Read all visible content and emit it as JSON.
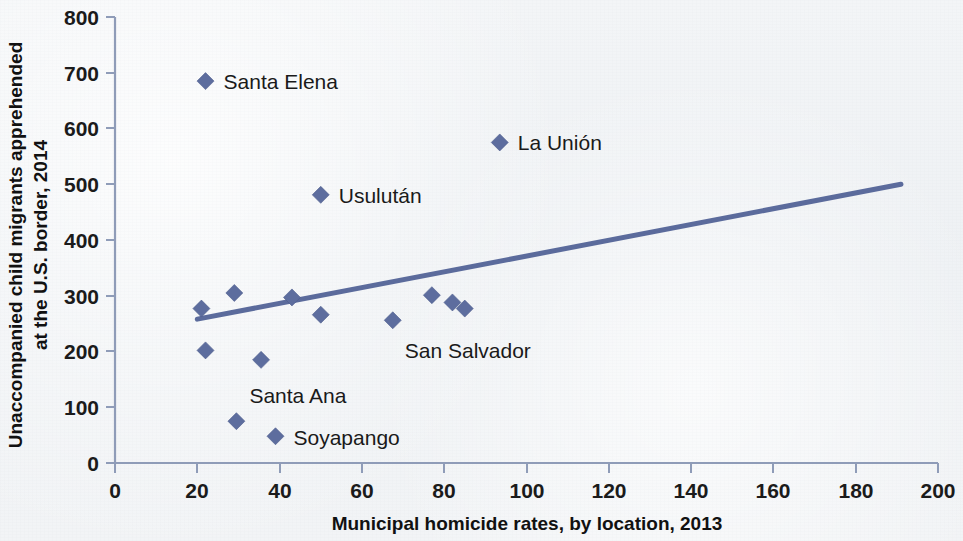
{
  "chart_data": {
    "type": "scatter",
    "title": "",
    "xlabel": "Municipal homicide rates, by location, 2013",
    "ylabel": "Unaccompanied child migrants apprehended at the U.S. border, 2014",
    "ylabel_line1": "Unaccompanied child migrants apprehended",
    "ylabel_line2": "at the U.S. border, 2014",
    "xlim": [
      0,
      200
    ],
    "ylim": [
      0,
      800
    ],
    "xticks": [
      0,
      20,
      40,
      60,
      80,
      100,
      120,
      140,
      160,
      180,
      200
    ],
    "yticks": [
      0,
      100,
      200,
      300,
      400,
      500,
      600,
      700,
      800
    ],
    "xtick_labels": [
      "0",
      "20",
      "40",
      "60",
      "80",
      "100",
      "120",
      "140",
      "160",
      "180",
      "200"
    ],
    "ytick_labels": [
      "0",
      "100",
      "200",
      "300",
      "400",
      "500",
      "600",
      "700",
      "800"
    ],
    "grid": false,
    "legend": "none",
    "marker_shape": "diamond",
    "marker_color": "#5d6d9e",
    "trendline_color": "#5b6b9c",
    "axis_color": "#8f9cb8",
    "background_color": "#f1f3f5",
    "points": [
      {
        "label": "Santa Elena",
        "x": 22,
        "y": 685,
        "label_pos": "right"
      },
      {
        "label": "La Unión",
        "x": 93.5,
        "y": 575,
        "label_pos": "right"
      },
      {
        "label": "Usulután",
        "x": 50,
        "y": 481,
        "label_pos": "right"
      },
      {
        "label": "",
        "x": 21,
        "y": 277,
        "label_pos": "none"
      },
      {
        "label": "",
        "x": 29,
        "y": 305,
        "label_pos": "none"
      },
      {
        "label": "",
        "x": 43,
        "y": 297,
        "label_pos": "none"
      },
      {
        "label": "",
        "x": 50,
        "y": 266,
        "label_pos": "none"
      },
      {
        "label": "",
        "x": 67.5,
        "y": 256,
        "label_pos": "none"
      },
      {
        "label": "",
        "x": 77,
        "y": 301,
        "label_pos": "none"
      },
      {
        "label": "",
        "x": 82,
        "y": 288,
        "label_pos": "none"
      },
      {
        "label": "",
        "x": 85,
        "y": 277,
        "label_pos": "none"
      },
      {
        "label": "",
        "x": 22,
        "y": 202,
        "label_pos": "none"
      },
      {
        "label": "",
        "x": 35.5,
        "y": 185,
        "label_pos": "none"
      },
      {
        "label": "Santa Ana",
        "x": 29.5,
        "y": 75,
        "label_pos": "above-right"
      },
      {
        "label": "Soyapango",
        "x": 39,
        "y": 48,
        "label_pos": "right"
      },
      {
        "label": "San Salvador",
        "x": 67.5,
        "y": 256,
        "label_pos": "below-right-anno"
      }
    ],
    "annotations": [
      {
        "text": "Santa Elena",
        "x": 22,
        "y": 685
      },
      {
        "text": "La Unión",
        "x": 93.5,
        "y": 575
      },
      {
        "text": "Usulután",
        "x": 50,
        "y": 481
      },
      {
        "text": "San Salvador",
        "x": 67.5,
        "y": 256
      },
      {
        "text": "Santa Ana",
        "x": 29.5,
        "y": 75
      },
      {
        "text": "Soyapango",
        "x": 39,
        "y": 48
      }
    ],
    "trendline": {
      "x_start": 20,
      "y_start": 258,
      "x_end": 191,
      "y_end": 500
    }
  }
}
